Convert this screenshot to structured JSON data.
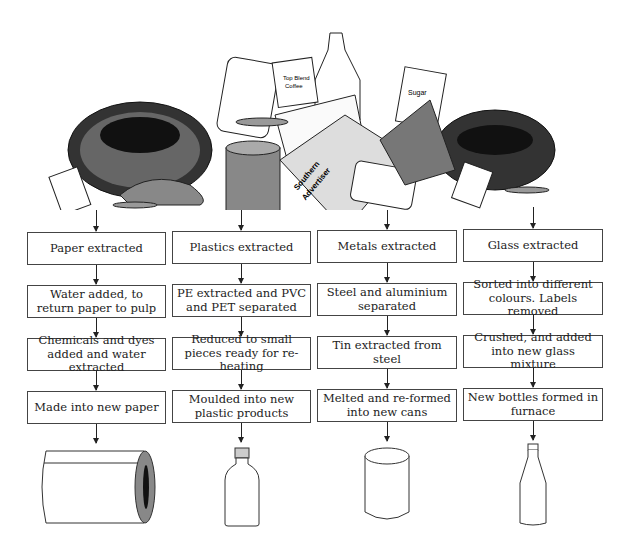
{
  "illustration": {
    "description": "pile of mixed household waste",
    "labels": [
      "Top Blend Coffee",
      "Sugar",
      "Southern Advertiser"
    ]
  },
  "columns": [
    {
      "material": "paper",
      "steps": [
        "Paper extracted",
        "Water added, to return paper to pulp",
        "Chemicals and dyes added and water extracted",
        "Made into new paper"
      ],
      "product_icon": "paper-roll-icon"
    },
    {
      "material": "plastics",
      "steps": [
        "Plastics extracted",
        "PE extracted and PVC and PET separated",
        "Reduced to small pieces ready for re-heating",
        "Moulded into new plastic products"
      ],
      "product_icon": "plastic-bottle-icon"
    },
    {
      "material": "metals",
      "steps": [
        "Metals extracted",
        "Steel and aluminium separated",
        "Tin extracted from steel",
        "Melted and re-formed into new cans"
      ],
      "product_icon": "can-icon"
    },
    {
      "material": "glass",
      "steps": [
        "Glass extracted",
        "Sorted into different colours. Labels removed",
        "Crushed, and added into new glass mixture",
        "New bottles formed in furnace"
      ],
      "product_icon": "glass-bottle-icon"
    }
  ]
}
